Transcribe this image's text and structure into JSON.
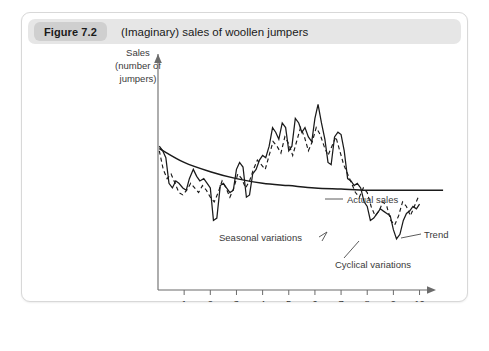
{
  "figure": {
    "badge": "Figure 7.2",
    "title": "(Imaginary) sales of woollen jumpers"
  },
  "chart_data": {
    "type": "line",
    "title": "(Imaginary) sales of woollen jumpers",
    "xlabel": "Years",
    "ylabel": "Sales (number of jumpers)",
    "ylabel_lines": [
      "Sales",
      "(number of",
      "jumpers)"
    ],
    "xlim": [
      0,
      10.4
    ],
    "ylim": [
      0,
      100
    ],
    "grid": false,
    "legend_position": "inline-annotations",
    "xticks": [
      "1",
      "2",
      "3",
      "4",
      "5",
      "6",
      "7",
      "8",
      "9",
      "10"
    ],
    "xtick_values": [
      1,
      2,
      3,
      4,
      5,
      6,
      7,
      8,
      9,
      10
    ],
    "yticks": [],
    "annotations": [
      {
        "name": "actual-sales",
        "label": "Actual sales"
      },
      {
        "name": "trend",
        "label": "Trend"
      },
      {
        "name": "seasonal-variations",
        "label": "Seasonal variations"
      },
      {
        "name": "cyclical-variations",
        "label": "Cyclical variations"
      }
    ],
    "series": [
      {
        "name": "Actual sales",
        "style": "solid",
        "color": "#1a1a1a",
        "x": [
          0.05,
          0.18,
          0.3,
          0.42,
          0.55,
          0.68,
          0.8,
          0.95,
          1.08,
          1.2,
          1.35,
          1.48,
          1.6,
          1.75,
          1.88,
          2.0,
          2.12,
          2.25,
          2.38,
          2.5,
          2.62,
          2.75,
          2.88,
          3.0,
          3.12,
          3.25,
          3.38,
          3.5,
          3.62,
          3.75,
          3.88,
          4.0,
          4.12,
          4.25,
          4.38,
          4.5,
          4.62,
          4.75,
          4.88,
          5.0,
          5.12,
          5.25,
          5.38,
          5.5,
          5.62,
          5.75,
          5.88,
          6.0,
          6.12,
          6.25,
          6.38,
          6.5,
          6.62,
          6.75,
          6.88,
          7.0,
          7.12,
          7.25,
          7.38,
          7.5,
          7.62,
          7.75,
          7.88,
          8.0,
          8.12,
          8.25,
          8.38,
          8.5,
          8.62,
          8.75,
          8.88,
          9.0,
          9.12,
          9.25,
          9.38,
          9.5,
          9.62,
          9.75,
          9.88,
          10.0
        ],
        "values": [
          62,
          60,
          57,
          46,
          44,
          47,
          46,
          44,
          43,
          48,
          52,
          49,
          47,
          48,
          46,
          44,
          30,
          31,
          45,
          46,
          44,
          42,
          43,
          52,
          55,
          53,
          40,
          41,
          50,
          52,
          56,
          58,
          57,
          62,
          70,
          68,
          65,
          72,
          70,
          60,
          62,
          74,
          72,
          68,
          70,
          66,
          64,
          74,
          80,
          72,
          65,
          55,
          54,
          66,
          68,
          67,
          60,
          48,
          47,
          45,
          46,
          44,
          38,
          36,
          30,
          31,
          33,
          35,
          34,
          33,
          32,
          26,
          22,
          24,
          30,
          33,
          34,
          36,
          35,
          37
        ]
      },
      {
        "name": "Seasonal variations",
        "style": "dashed",
        "color": "#1a1a1a",
        "x": [
          0.05,
          0.2,
          0.35,
          0.5,
          0.65,
          0.8,
          0.95,
          1.1,
          1.25,
          1.4,
          1.55,
          1.7,
          1.85,
          2.0,
          2.15,
          2.3,
          2.45,
          2.6,
          2.75,
          2.9,
          3.05,
          3.2,
          3.35,
          3.5,
          3.65,
          3.8,
          3.95,
          4.1,
          4.25,
          4.4,
          4.55,
          4.7,
          4.85,
          5.0,
          5.15,
          5.3,
          5.45,
          5.6,
          5.75,
          5.9,
          6.05,
          6.2,
          6.35,
          6.5,
          6.65,
          6.8,
          6.95,
          7.1,
          7.25,
          7.4,
          7.55,
          7.7,
          7.85,
          8.0,
          8.15,
          8.3,
          8.45,
          8.6,
          8.75,
          8.9,
          9.05,
          9.2,
          9.35,
          9.5,
          9.65,
          9.8,
          9.95
        ],
        "values": [
          60,
          52,
          48,
          50,
          46,
          42,
          41,
          43,
          46,
          44,
          42,
          45,
          43,
          40,
          38,
          42,
          47,
          44,
          40,
          44,
          50,
          48,
          44,
          47,
          52,
          56,
          54,
          52,
          58,
          64,
          62,
          59,
          66,
          63,
          58,
          64,
          70,
          66,
          60,
          64,
          70,
          67,
          62,
          58,
          62,
          66,
          60,
          54,
          50,
          46,
          42,
          40,
          44,
          42,
          36,
          32,
          34,
          38,
          36,
          30,
          28,
          32,
          38,
          36,
          32,
          36,
          40
        ]
      },
      {
        "name": "Trend",
        "style": "solid-smooth",
        "color": "#1a1a1a",
        "x": [
          0.05,
          1.0,
          2.0,
          3.0,
          4.0,
          5.0,
          6.0,
          7.0,
          8.0,
          9.0,
          10.0,
          10.9
        ],
        "values": [
          61,
          55,
          51,
          48,
          46,
          45,
          44,
          43.5,
          43,
          43,
          43,
          43
        ]
      }
    ]
  }
}
